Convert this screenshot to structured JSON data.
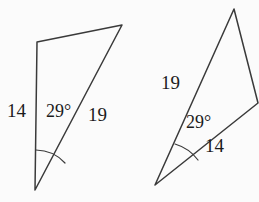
{
  "figure": {
    "background_color": "#fbfbfb",
    "stroke_color": "#3a3a3a",
    "text_color": "#1b1b1b",
    "angle_unit": "degrees"
  },
  "triangles": [
    {
      "id": "left-triangle",
      "name": "left-triangle",
      "vertices": {
        "top_left": {
          "x": 37,
          "y": 42
        },
        "top_right": {
          "x": 122,
          "y": 25
        },
        "bottom": {
          "x": 35,
          "y": 190
        }
      },
      "angle": {
        "value": "29°",
        "number": 29,
        "at_vertex": "bottom",
        "label_x": 46,
        "label_y": 113
      },
      "sides": [
        {
          "name": "left-side",
          "label": "14",
          "value": 14,
          "label_x": 7,
          "label_y": 113,
          "from": "bottom",
          "to": "top_left"
        },
        {
          "name": "right-side",
          "label": "19",
          "value": 19,
          "label_x": 88,
          "label_y": 117,
          "from": "bottom",
          "to": "top_right"
        }
      ],
      "arc": {
        "cx": 35,
        "cy": 190,
        "r": 40,
        "start_x": 36,
        "start_y": 150,
        "end_x": 65,
        "end_y": 163
      }
    },
    {
      "id": "right-triangle",
      "name": "right-triangle",
      "vertices": {
        "apex": {
          "x": 234,
          "y": 9
        },
        "bottom_left": {
          "x": 155,
          "y": 185
        },
        "right": {
          "x": 258,
          "y": 103
        }
      },
      "angle": {
        "value": "29°",
        "number": 29,
        "at_vertex": "bottom_left",
        "label_x": 186,
        "label_y": 124
      },
      "sides": [
        {
          "name": "upper-left-side",
          "label": "19",
          "value": 19,
          "label_x": 161,
          "label_y": 85,
          "from": "bottom_left",
          "to": "apex"
        },
        {
          "name": "lower-right-side",
          "label": "14",
          "value": 14,
          "label_x": 205,
          "label_y": 148,
          "from": "bottom_left",
          "to": "right"
        }
      ],
      "arc": {
        "cx": 155,
        "cy": 185,
        "r": 45,
        "start_x": 175,
        "start_y": 144,
        "end_x": 198,
        "end_y": 160
      }
    }
  ]
}
